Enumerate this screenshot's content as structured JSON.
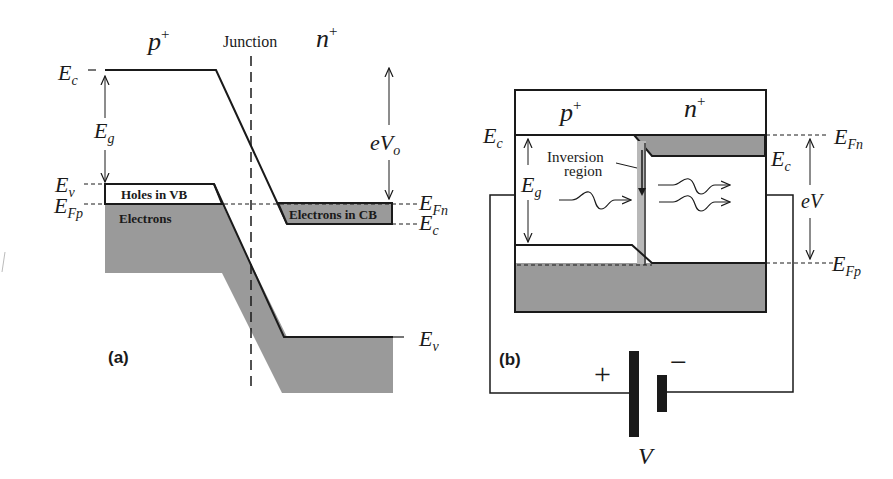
{
  "colors": {
    "line": "#1a1a1a",
    "fill_gray": "#9a9a9a",
    "strip_gray": "#b8b8b8",
    "background": "#ffffff"
  },
  "panel_a": {
    "label": "(a)",
    "region_p": "p",
    "region_p_sup": "+",
    "region_n": "n",
    "region_n_sup": "+",
    "junction_label": "Junction",
    "Ec_label": "E",
    "Ec_sub": "c",
    "Eg_label": "E",
    "Eg_sub": "g",
    "Ev_label": "E",
    "Ev_sub": "v",
    "EFp_label": "E",
    "EFp_sub": "Fp",
    "holes_label": "Holes in VB",
    "electrons_label": "Electrons",
    "electrons_cb_label": "Electrons in CB",
    "eVo_label": "eV",
    "eVo_sub": "o",
    "EFn_label": "E",
    "EFn_sub": "Fn",
    "Ec_right_label": "E",
    "Ec_right_sub": "c",
    "Ev_right_label": "E",
    "Ev_right_sub": "v"
  },
  "panel_b": {
    "label": "(b)",
    "region_p": "p",
    "region_p_sup": "+",
    "region_n": "n",
    "region_n_sup": "+",
    "Ec_left_label": "E",
    "Ec_left_sub": "c",
    "Ec_right_label": "E",
    "Ec_right_sub": "c",
    "EFn_label": "E",
    "EFn_sub": "Fn",
    "EFp_label": "E",
    "EFp_sub": "Fp",
    "Eg_label": "E",
    "Eg_sub": "g",
    "inversion_label_line1": "Inversion",
    "inversion_label_line2": "region",
    "eV_label": "eV",
    "battery_plus": "+",
    "battery_minus": "−",
    "battery_label": "V"
  }
}
